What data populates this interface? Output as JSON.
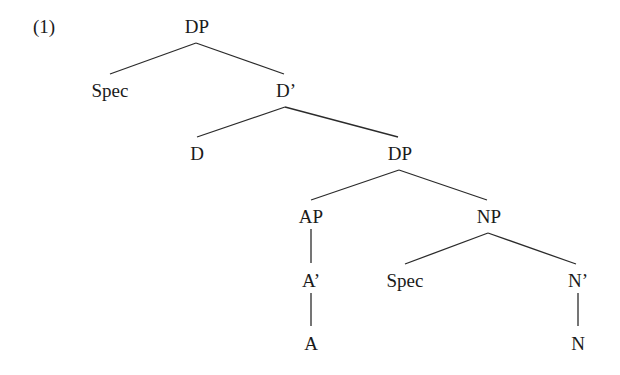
{
  "example_number": "(1)",
  "tree": {
    "nodes": [
      {
        "id": "dp1",
        "label": "DP"
      },
      {
        "id": "spec1",
        "label": "Spec"
      },
      {
        "id": "dbar",
        "label": "D’"
      },
      {
        "id": "d",
        "label": "D"
      },
      {
        "id": "dp2",
        "label": "DP"
      },
      {
        "id": "ap",
        "label": "AP"
      },
      {
        "id": "np",
        "label": "NP"
      },
      {
        "id": "abar",
        "label": "A’"
      },
      {
        "id": "a",
        "label": "A"
      },
      {
        "id": "spec2",
        "label": "Spec"
      },
      {
        "id": "nbar",
        "label": "N’"
      },
      {
        "id": "n",
        "label": "N"
      }
    ],
    "edges": [
      [
        "dp1",
        "spec1"
      ],
      [
        "dp1",
        "dbar"
      ],
      [
        "dbar",
        "d"
      ],
      [
        "dbar",
        "dp2"
      ],
      [
        "dp2",
        "ap"
      ],
      [
        "dp2",
        "np"
      ],
      [
        "ap",
        "abar"
      ],
      [
        "abar",
        "a"
      ],
      [
        "np",
        "spec2"
      ],
      [
        "np",
        "nbar"
      ],
      [
        "nbar",
        "n"
      ]
    ]
  }
}
